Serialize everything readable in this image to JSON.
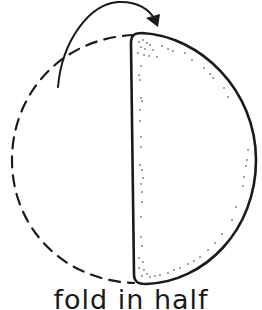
{
  "diagram": {
    "caption": "fold in half",
    "stroke_color": "#1a1a1a",
    "background": "#ffffff",
    "elements": [
      {
        "name": "unfolded-half",
        "style": "dashed",
        "description": "left half of circle outline"
      },
      {
        "name": "folded-half",
        "style": "solid stippled",
        "description": "half-moon folded over"
      },
      {
        "name": "fold-arrow",
        "style": "solid curved arrow",
        "direction": "left to right over top"
      }
    ]
  }
}
